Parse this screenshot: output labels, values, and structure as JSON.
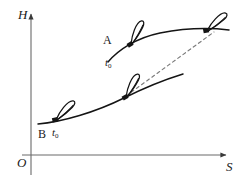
{
  "figure": {
    "background": "#ffffff",
    "ink": "#1a1a1a",
    "axis_color": "#5a5a5a"
  },
  "axes": {
    "y_label": "H",
    "x_label": "S",
    "origin_label": "O"
  },
  "annotations": {
    "curve_a_label": "A",
    "curve_a_time": "t",
    "curve_a_time_sub": "0",
    "curve_b_label": "B",
    "curve_b_time": "t",
    "curve_b_time_sub": "0"
  },
  "chart_data": {
    "type": "line",
    "xlabel": "S",
    "ylabel": "H",
    "xlim": [
      0,
      240
    ],
    "ylim": [
      0,
      185
    ],
    "grid": false,
    "legend": "none",
    "series": [
      {
        "name": "A",
        "style": "solid",
        "label": "A",
        "annotation": "t0",
        "path": "M108,62 C118,50 136,38 160,33 C186,28 212,28 229,30",
        "points": [
          [
            108,
            62
          ],
          [
            130,
            42
          ],
          [
            160,
            33
          ],
          [
            195,
            29
          ],
          [
            229,
            30
          ]
        ]
      },
      {
        "name": "B",
        "style": "solid",
        "label": "B",
        "annotation": "t0",
        "path": "M38,124 C62,122 96,112 124,98 C150,85 170,78 183,74",
        "points": [
          [
            38,
            124
          ],
          [
            80,
            117
          ],
          [
            124,
            98
          ],
          [
            160,
            80
          ],
          [
            183,
            74
          ]
        ]
      },
      {
        "name": "connector",
        "style": "dashed",
        "path": "M126,96 L214,32",
        "points": [
          [
            126,
            96
          ],
          [
            214,
            32
          ]
        ]
      }
    ],
    "markers": [
      {
        "name": "vane-a-left",
        "x": 132,
        "y": 44,
        "angle": -32
      },
      {
        "name": "vane-a-right",
        "x": 208,
        "y": 31,
        "angle": -10
      },
      {
        "name": "vane-b-mid",
        "x": 127,
        "y": 97,
        "angle": -30
      },
      {
        "name": "vane-b-left",
        "x": 57,
        "y": 120,
        "angle": -14
      }
    ]
  }
}
